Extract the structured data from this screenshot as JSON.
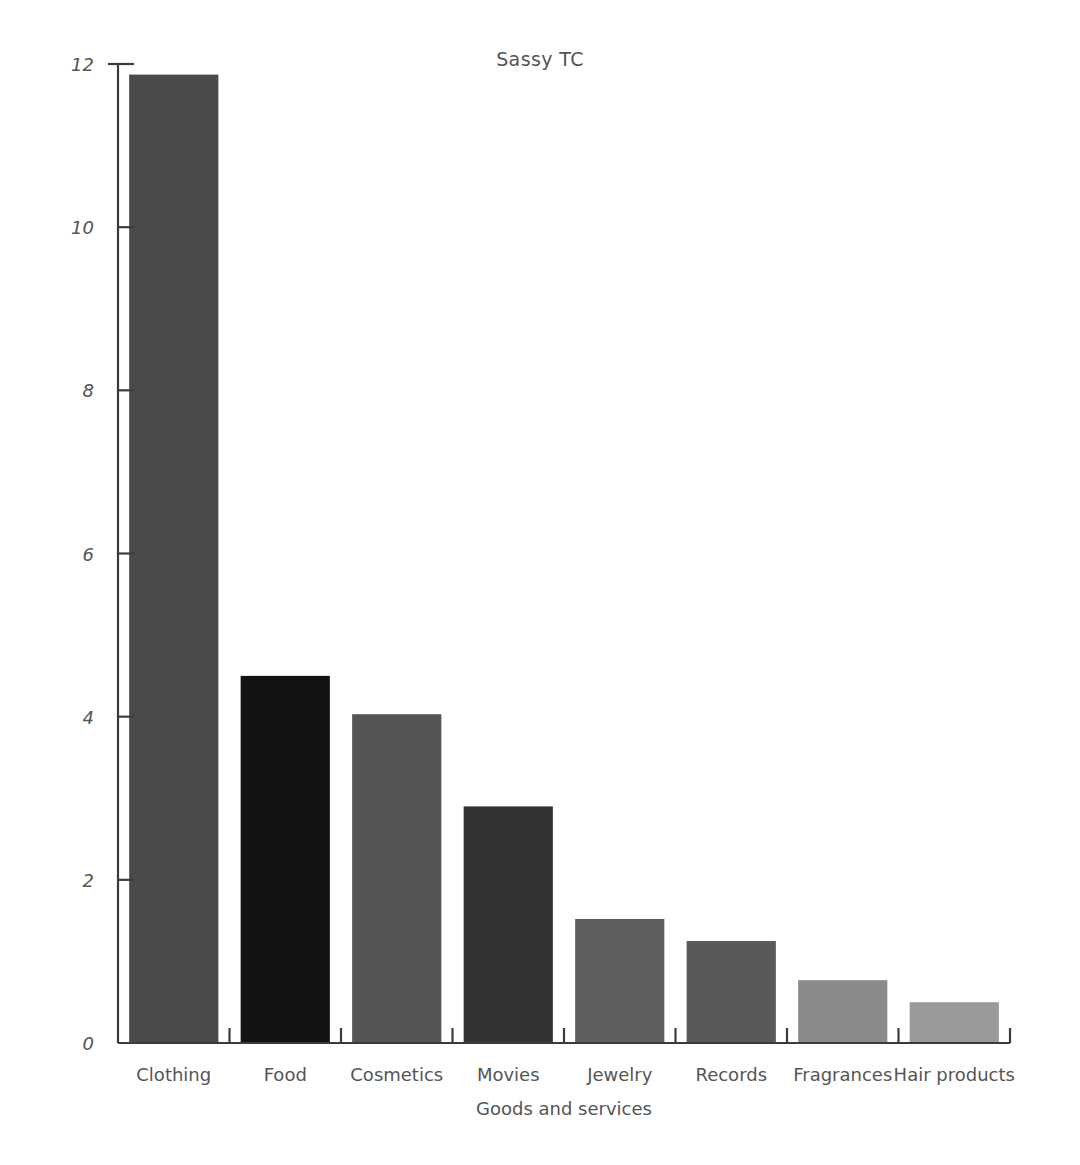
{
  "chart_data": {
    "type": "bar",
    "title": "Sassy TC",
    "xlabel": "Goods and services",
    "ylabel": "Billions of dollars",
    "categories": [
      "Clothing",
      "Food",
      "Cosmetics",
      "Movies",
      "Jewelry",
      "Records",
      "Fragrances",
      "Hair products"
    ],
    "values": [
      11.87,
      4.5,
      4.03,
      2.9,
      1.52,
      1.25,
      0.77,
      0.5
    ],
    "bar_colors": [
      "#4a4a4a",
      "#121212",
      "#555555",
      "#333333",
      "#5e5e5e",
      "#595959",
      "#8a8a8a",
      "#9a9a9a"
    ],
    "ylim": [
      0,
      12
    ],
    "yticks": [
      0,
      2,
      4,
      6,
      8,
      10,
      12
    ],
    "ytick_labels": [
      "0",
      "2",
      "4",
      "6",
      "8",
      "10",
      "12"
    ],
    "grid": false,
    "legend": "none"
  },
  "axes": {
    "tick_direction": "inward",
    "axis_color": "#3b3b3b"
  }
}
